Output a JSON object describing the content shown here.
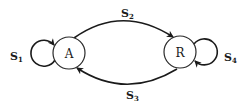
{
  "diagram": {
    "type": "state-transition",
    "nodes": [
      {
        "id": "A",
        "label": "A"
      },
      {
        "id": "R",
        "label": "R"
      }
    ],
    "edges": [
      {
        "id": "s1",
        "from": "A",
        "to": "A",
        "label_main": "S",
        "label_sub": "1"
      },
      {
        "id": "s2",
        "from": "A",
        "to": "R",
        "label_main": "S",
        "label_sub": "2"
      },
      {
        "id": "s3",
        "from": "R",
        "to": "A",
        "label_main": "S",
        "label_sub": "3"
      },
      {
        "id": "s4",
        "from": "R",
        "to": "R",
        "label_main": "S",
        "label_sub": "4"
      }
    ]
  },
  "colors": {
    "stroke": "#1a1a1a",
    "background": "#ffffff"
  }
}
